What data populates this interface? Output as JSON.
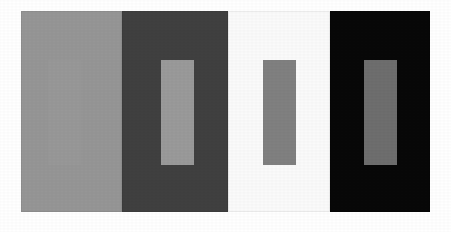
{
  "figure": {
    "caption": "",
    "width": 451,
    "height": 232,
    "page_background": "#ffffff"
  },
  "chart_data": {
    "type": "heatmap",
    "xlabel": "",
    "ylabel": "",
    "legend_position": "none",
    "grid": false,
    "categories": [
      "light-gray surround",
      "dark-gray surround",
      "white surround",
      "black surround"
    ],
    "series": [
      {
        "name": "surround luminance (0-255)",
        "values": [
          150,
          64,
          250,
          8
        ]
      },
      {
        "name": "test patch luminance (0-255)",
        "values": [
          152,
          154,
          128,
          110
        ]
      }
    ],
    "x": [
      1,
      2,
      3,
      4
    ],
    "ylim": [
      0,
      255
    ]
  },
  "panels": [
    {
      "id": "panel-light-gray",
      "label": "Panel 1",
      "background_color": "#969696",
      "x": 21,
      "y": 11,
      "width": 101,
      "height": 201,
      "patch": {
        "id": "patch-1",
        "label": "Test patch on light-gray surround",
        "color": "#989898",
        "x": 48,
        "y": 60,
        "width": 33,
        "height": 105,
        "visible": "barely"
      }
    },
    {
      "id": "panel-dark-gray",
      "label": "Panel 2",
      "background_color": "#404040",
      "x": 122,
      "y": 11,
      "width": 106,
      "height": 201,
      "patch": {
        "id": "patch-2",
        "label": "Test patch on dark-gray surround",
        "color": "#9a9a9a",
        "x": 161,
        "y": 60,
        "width": 33,
        "height": 105,
        "visible": "high"
      }
    },
    {
      "id": "panel-white",
      "label": "Panel 3",
      "background_color": "#fafafa",
      "x": 228,
      "y": 11,
      "width": 102,
      "height": 201,
      "patch": {
        "id": "patch-3",
        "label": "Test patch on white surround",
        "color": "#808080",
        "x": 263,
        "y": 60,
        "width": 33,
        "height": 105,
        "visible": "high"
      }
    },
    {
      "id": "panel-black",
      "label": "Panel 4",
      "background_color": "#080808",
      "x": 330,
      "y": 11,
      "width": 100,
      "height": 201,
      "patch": {
        "id": "patch-4",
        "label": "Test patch on black surround",
        "color": "#6e6e6e",
        "x": 364,
        "y": 60,
        "width": 33,
        "height": 105,
        "visible": "high"
      }
    }
  ]
}
